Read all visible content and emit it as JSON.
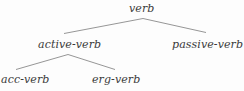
{
  "figure": {
    "kind": "syntax-tree",
    "background_color": "#fdfdfd",
    "text_color": "#3a3a3a",
    "edge_color": "#8a8a8a"
  },
  "tree": {
    "root": {
      "id": "verb",
      "label": "verb"
    },
    "level2": [
      {
        "id": "active-verb",
        "label": "active-verb"
      },
      {
        "id": "passive-verb",
        "label": "passive-verb"
      }
    ],
    "level3": [
      {
        "id": "acc-verb",
        "label": "acc-verb"
      },
      {
        "id": "erg-verb",
        "label": "erg-verb"
      }
    ]
  },
  "edges": [
    {
      "id": "verb-to-active-verb",
      "from": "verb",
      "to": "active-verb"
    },
    {
      "id": "verb-to-passive-verb",
      "from": "verb",
      "to": "passive-verb"
    },
    {
      "id": "active-verb-to-acc-verb",
      "from": "active-verb",
      "to": "acc-verb"
    },
    {
      "id": "active-verb-to-erg-verb",
      "from": "active-verb",
      "to": "erg-verb"
    }
  ]
}
